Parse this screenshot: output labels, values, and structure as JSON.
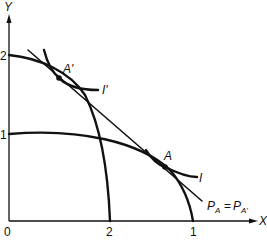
{
  "figure": {
    "axes": {
      "x_label": "X",
      "y_label": "Y",
      "origin_label": "0",
      "y_ticks": [
        "2",
        "1"
      ],
      "x_ticks": [
        "2",
        "1"
      ]
    },
    "points": {
      "a_prime": "A'",
      "a": "A"
    },
    "curves": {
      "indifference_i_prime": "I'",
      "indifference_i": "I"
    },
    "price_line": {
      "label_p": "P",
      "sub_a": "A",
      "equals": "=",
      "label_p2": "P",
      "sub_a_prime": "A'"
    }
  }
}
